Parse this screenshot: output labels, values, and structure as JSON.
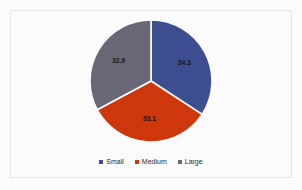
{
  "chart_data": {
    "type": "pie",
    "title": "",
    "subtitle": "",
    "xlabel": "",
    "ylabel": "",
    "categories": [
      "Small",
      "Medium",
      "Large"
    ],
    "values": [
      34.3,
      33.1,
      32.9
    ],
    "data_labels": [
      "34.3",
      "33.1",
      "32.9"
    ],
    "colors": [
      "#3e4f92",
      "#d1380c",
      "#6b6878"
    ],
    "slices": [
      {
        "name": "Small",
        "value": 34.3,
        "label": "34.3",
        "color": "#3e4f92",
        "start_angle_deg": 0,
        "end_angle_deg": 123.5
      },
      {
        "name": "Medium",
        "value": 33.1,
        "label": "33.1",
        "color": "#d1380c",
        "start_angle_deg": 123.5,
        "end_angle_deg": 242.6
      },
      {
        "name": "Large",
        "value": 32.9,
        "label": "32.9",
        "color": "#6b6878",
        "start_angle_deg": 242.6,
        "end_angle_deg": 360
      }
    ],
    "legend": {
      "position": "bottom",
      "orientation": "horizontal",
      "entries": [
        {
          "label": "Small",
          "color": "#3e4f92"
        },
        {
          "label": "Medium",
          "color": "#d1380c"
        },
        {
          "label": "Large",
          "color": "#6b6878"
        }
      ]
    },
    "grid": false,
    "start_angle_note": "first slice begins at 12 o'clock, drawn clockwise",
    "slice_separator_color": "#ffffff"
  },
  "figure": {
    "background_color": "#ffffff",
    "border_color": "#e8e8e8"
  }
}
